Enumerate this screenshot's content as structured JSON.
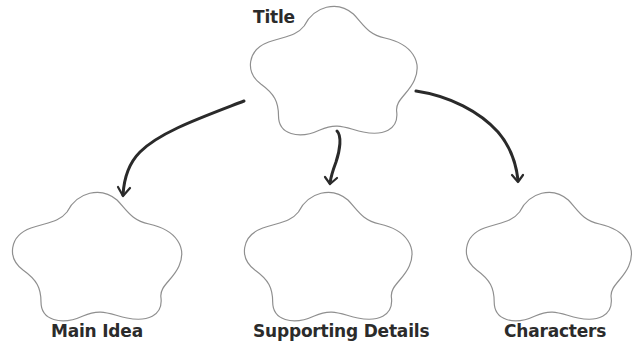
{
  "diagram": {
    "type": "graphic-organizer",
    "title_node": {
      "label": "Title"
    },
    "child_nodes": [
      {
        "label": "Main Idea"
      },
      {
        "label": "Supporting Details"
      },
      {
        "label": "Characters"
      }
    ],
    "edges": [
      {
        "from": "Title",
        "to": "Main Idea"
      },
      {
        "from": "Title",
        "to": "Supporting Details"
      },
      {
        "from": "Title",
        "to": "Characters"
      }
    ],
    "colors": {
      "cloud_outline": "#8f8f8f",
      "arrow": "#2a2a2a",
      "text": "#2b2b2b",
      "background": "#ffffff"
    }
  }
}
